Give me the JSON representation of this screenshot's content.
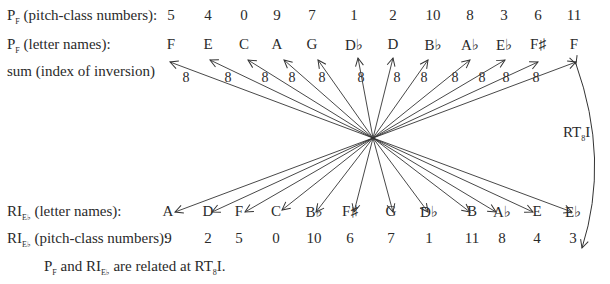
{
  "rows": {
    "pf_numbers": {
      "label_main": "P",
      "label_sub": "F",
      "label_rest": " (pitch-class numbers):",
      "values": [
        "5",
        "4",
        "0",
        "9",
        "7",
        "1",
        "2",
        "10",
        "8",
        "3",
        "6",
        "11"
      ]
    },
    "pf_letters": {
      "label_main": "P",
      "label_sub": "F",
      "label_rest": " (letter names):",
      "values": [
        "F",
        "E",
        "C",
        "A",
        "G",
        "D♭",
        "D",
        "B♭",
        "A♭",
        "E♭",
        "F♯",
        "F"
      ]
    },
    "sum": {
      "label": "sum (index of inversion)",
      "values": [
        "8",
        "8",
        "8",
        "8",
        "8",
        "8",
        "8",
        "8",
        "8",
        "8",
        "8",
        "8"
      ]
    },
    "ri_letters": {
      "label_main": "RI",
      "label_sub": "E♭",
      "label_rest": " (letter names):",
      "values": [
        "A",
        "D",
        "F",
        "C",
        "B♭",
        "F♯",
        "G",
        "D♭",
        "B",
        "A♭",
        "E",
        "E♭"
      ]
    },
    "ri_numbers": {
      "label_main": "RI",
      "label_sub": "E♭",
      "label_rest": " (pitch-class numbers):",
      "values": [
        "9",
        "2",
        "5",
        "0",
        "10",
        "6",
        "7",
        "1",
        "11",
        "8",
        "4",
        "3"
      ]
    }
  },
  "transform_label": {
    "main": "RT",
    "sub": "8",
    "rest": "I"
  },
  "caption": {
    "p": "P",
    "p_sub": "F",
    "mid": " and RI",
    "ri_sub": "E♭",
    "rest": " are related at RT",
    "rt_sub": "8",
    "end": "I."
  }
}
